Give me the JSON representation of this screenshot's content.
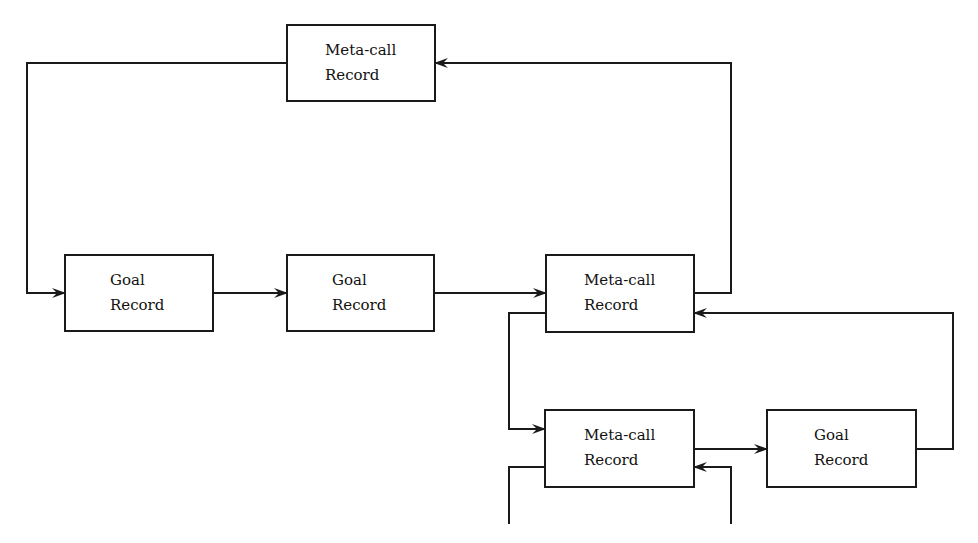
{
  "diagram": {
    "nodes": [
      {
        "id": "meta_top",
        "line1": "Meta-call",
        "line2": "Record",
        "x": 287,
        "y": 25,
        "w": 148,
        "h": 76
      },
      {
        "id": "goal_1",
        "line1": "Goal",
        "line2": "Record",
        "x": 65,
        "y": 255,
        "w": 148,
        "h": 76
      },
      {
        "id": "goal_2",
        "line1": "Goal",
        "line2": "Record",
        "x": 287,
        "y": 255,
        "w": 147,
        "h": 76
      },
      {
        "id": "meta_mid",
        "line1": "Meta-call",
        "line2": "Record",
        "x": 546,
        "y": 255,
        "w": 148,
        "h": 77
      },
      {
        "id": "meta_bottom",
        "line1": "Meta-call",
        "line2": "Record",
        "x": 545,
        "y": 410,
        "w": 149,
        "h": 77
      },
      {
        "id": "goal_3",
        "line1": "Goal",
        "line2": "Record",
        "x": 767,
        "y": 410,
        "w": 149,
        "h": 77
      }
    ],
    "edges": [
      {
        "from": "meta_top",
        "to": "goal_1"
      },
      {
        "from": "goal_1",
        "to": "goal_2"
      },
      {
        "from": "goal_2",
        "to": "meta_mid"
      },
      {
        "from": "meta_mid",
        "to": "meta_top"
      },
      {
        "from": "meta_mid",
        "to": "meta_bottom"
      },
      {
        "from": "meta_bottom",
        "to": "goal_3"
      },
      {
        "from": "goal_3",
        "to": "meta_mid"
      },
      {
        "from": "meta_bottom",
        "to": "(continues below)"
      },
      {
        "from": "(continues below)",
        "to": "meta_bottom"
      }
    ]
  }
}
